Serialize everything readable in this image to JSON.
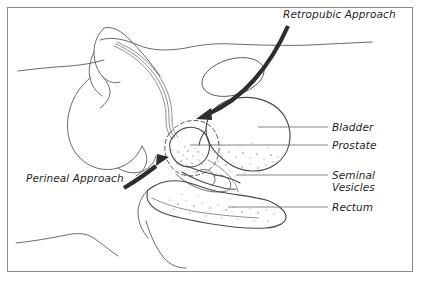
{
  "figure": {
    "background_color": "#ffffff",
    "border_color": "#8a8a8a",
    "line_color": "#595959",
    "arrow_color": "#2e2e2e",
    "text_color": "#1f1f1f"
  },
  "annotations": {
    "retropubic_approach": "Retropubic Approach",
    "perineal_approach": "Perineal Approach"
  },
  "labels": [
    {
      "id": "bladder",
      "text": "Bladder"
    },
    {
      "id": "prostate",
      "text": "Prostate"
    },
    {
      "id": "seminal",
      "text": "Seminal"
    },
    {
      "id": "vesicles",
      "text": "Vesicles"
    },
    {
      "id": "rectum",
      "text": "Rectum"
    }
  ],
  "structures": [
    {
      "name": "bladder",
      "description": "large rounded organ, upper right of pelvis"
    },
    {
      "name": "prostate",
      "description": "small rounded stippled organ below bladder neck"
    },
    {
      "name": "seminal-vesicles",
      "description": "coiled tubular structures posterior to prostate"
    },
    {
      "name": "rectum",
      "description": "elongated lobed stippled structure, inferior posterior"
    },
    {
      "name": "penis-shaft",
      "description": "anterior tubular outline with urethra"
    },
    {
      "name": "scrotum",
      "description": "rounded inferior anterior outline"
    },
    {
      "name": "pubic-bone",
      "description": "oval structure anterior superior to bladder"
    },
    {
      "name": "abdominal-wall",
      "description": "upper body contour line"
    },
    {
      "name": "thigh-contour",
      "description": "lower body contour lines"
    }
  ]
}
